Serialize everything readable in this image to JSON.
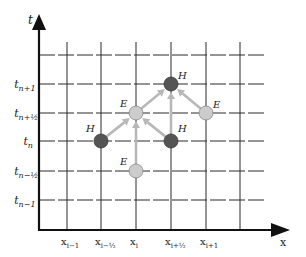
{
  "diagram": {
    "axes": {
      "t_label": "t",
      "x_label": "x"
    },
    "t_ticks": [
      {
        "main": "t",
        "sub": "n+1",
        "row": 1
      },
      {
        "main": "t",
        "sub": "n+½",
        "row": 2
      },
      {
        "main": "t",
        "sub": "n",
        "row": 3
      },
      {
        "main": "t",
        "sub": "n−½",
        "row": 4
      },
      {
        "main": "t",
        "sub": "n−1",
        "row": 5
      }
    ],
    "x_ticks": [
      {
        "main": "x",
        "sub": "i−1",
        "col": 1
      },
      {
        "main": "x",
        "sub": "i−½",
        "col": 2
      },
      {
        "main": "x",
        "sub": "i",
        "col": 3
      },
      {
        "main": "x",
        "sub": "i+½",
        "col": 4
      },
      {
        "main": "x",
        "sub": "i+1",
        "col": 5
      }
    ],
    "nodes": [
      {
        "id": "H-left",
        "type": "H",
        "label": "H",
        "x": "x_{i-1/2}",
        "t": "t_n",
        "col": 2,
        "row": 3
      },
      {
        "id": "E-center",
        "type": "E",
        "label": "E",
        "x": "x_i",
        "t": "t_{n+1/2}",
        "col": 3,
        "row": 2
      },
      {
        "id": "E-bottom",
        "type": "E",
        "label": "E",
        "x": "x_i",
        "t": "t_{n-1/2}",
        "col": 3,
        "row": 4
      },
      {
        "id": "H-right",
        "type": "H",
        "label": "H",
        "x": "x_{i+1/2}",
        "t": "t_n",
        "col": 4,
        "row": 3
      },
      {
        "id": "H-top",
        "type": "H",
        "label": "H",
        "x": "x_{i+1/2}",
        "t": "t_{n+1}",
        "col": 4,
        "row": 1
      },
      {
        "id": "E-right",
        "type": "E",
        "label": "E",
        "x": "x_{i+1}",
        "t": "t_{n+1/2}",
        "col": 5,
        "row": 2
      }
    ],
    "arrows": [
      {
        "from": "H-left",
        "to": "E-center"
      },
      {
        "from": "E-bottom",
        "to": "E-center"
      },
      {
        "from": "H-right",
        "to": "E-center"
      },
      {
        "from": "E-center",
        "to": "H-top"
      },
      {
        "from": "H-right",
        "to": "H-top"
      },
      {
        "from": "E-right",
        "to": "H-top"
      }
    ],
    "colors": {
      "H_fill": "#555555",
      "E_fill": "#cccccc",
      "arrow": "#b8b8b8",
      "grid": "#2a2a2a"
    }
  }
}
